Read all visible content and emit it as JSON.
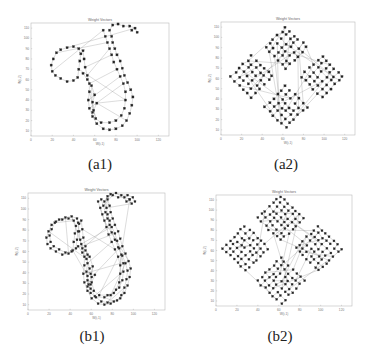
{
  "figure": {
    "captions": [
      "(a1)",
      "(a2)",
      "(b1)",
      "(b2)"
    ]
  },
  "chart_data": [
    {
      "id": "a1",
      "type": "scatter",
      "title": "Weight Vectors",
      "xlabel": "W(i,1)",
      "ylabel": "W(i,2)",
      "xlim": [
        0,
        130
      ],
      "ylim": [
        5,
        115
      ],
      "xticks": [
        0,
        20,
        40,
        60,
        80,
        100,
        120
      ],
      "yticks": [
        10,
        20,
        30,
        40,
        50,
        60,
        70,
        80,
        90,
        100,
        110
      ],
      "shape": "two-lobed curve (small circle upper-left, large loop right), single chain of nodes",
      "nodes": [
        [
          20,
          68
        ],
        [
          19,
          74
        ],
        [
          21,
          80
        ],
        [
          24,
          86
        ],
        [
          28,
          89
        ],
        [
          34,
          91
        ],
        [
          40,
          92
        ],
        [
          45,
          90
        ],
        [
          47,
          85
        ],
        [
          46,
          78
        ],
        [
          45,
          70
        ],
        [
          44,
          62
        ],
        [
          40,
          59
        ],
        [
          34,
          58
        ],
        [
          28,
          61
        ],
        [
          23,
          64
        ],
        [
          49,
          88
        ],
        [
          50,
          80
        ],
        [
          51,
          72
        ],
        [
          53,
          64
        ],
        [
          55,
          56
        ],
        [
          55,
          48
        ],
        [
          54,
          40
        ],
        [
          55,
          32
        ],
        [
          58,
          24
        ],
        [
          62,
          17
        ],
        [
          68,
          12
        ],
        [
          74,
          11
        ],
        [
          80,
          12
        ],
        [
          86,
          15
        ],
        [
          90,
          20
        ],
        [
          93,
          27
        ],
        [
          95,
          35
        ],
        [
          96,
          43
        ],
        [
          94,
          50
        ],
        [
          91,
          57
        ],
        [
          88,
          64
        ],
        [
          86,
          71
        ],
        [
          84,
          78
        ],
        [
          81,
          84
        ],
        [
          79,
          90
        ],
        [
          77,
          96
        ],
        [
          76,
          102
        ],
        [
          74,
          108
        ],
        [
          77,
          113
        ],
        [
          82,
          114
        ],
        [
          87,
          112
        ],
        [
          93,
          112
        ],
        [
          98,
          110
        ],
        [
          100,
          106
        ],
        [
          68,
          108
        ],
        [
          70,
          102
        ],
        [
          72,
          96
        ],
        [
          74,
          90
        ],
        [
          76,
          84
        ],
        [
          78,
          77
        ],
        [
          81,
          70
        ],
        [
          84,
          63
        ],
        [
          87,
          56
        ],
        [
          89,
          48
        ],
        [
          89,
          40
        ],
        [
          88,
          32
        ],
        [
          85,
          25
        ],
        [
          80,
          20
        ],
        [
          74,
          18
        ],
        [
          66,
          18
        ],
        [
          61,
          22
        ],
        [
          59,
          30
        ],
        [
          58,
          38
        ],
        [
          60,
          45
        ],
        [
          57,
          54
        ],
        [
          53,
          60
        ],
        [
          49,
          66
        ],
        [
          62,
          37
        ],
        [
          58,
          28
        ],
        [
          95,
          108
        ]
      ],
      "extra_edges": [
        [
          0,
          50
        ],
        [
          10,
          60
        ],
        [
          18,
          54
        ],
        [
          20,
          56
        ],
        [
          22,
          57
        ],
        [
          23,
          58
        ],
        [
          19,
          53
        ],
        [
          21,
          66
        ],
        [
          24,
          70
        ],
        [
          73,
          30
        ],
        [
          73,
          60
        ],
        [
          5,
          48
        ],
        [
          3,
          52
        ]
      ]
    },
    {
      "id": "a2",
      "type": "scatter",
      "title": "Weight Vectors",
      "xlabel": "W(i,1)",
      "ylabel": "W(i,2)",
      "xlim": [
        0,
        130
      ],
      "ylim": [
        5,
        115
      ],
      "xticks": [
        0,
        20,
        40,
        60,
        80,
        100,
        120
      ],
      "yticks": [
        10,
        20,
        30,
        40,
        50,
        60,
        70,
        80,
        90,
        100,
        110
      ],
      "shape": "diamond composed of four square-grid clusters (top, left, right, bottom)",
      "clusters": [
        {
          "name": "top",
          "center": [
            63,
            90
          ],
          "half_span": 20
        },
        {
          "name": "left",
          "center": [
            30,
            62
          ],
          "half_span": 20
        },
        {
          "name": "right",
          "center": [
            98,
            62
          ],
          "half_span": 20
        },
        {
          "name": "bottom",
          "center": [
            63,
            32
          ],
          "half_span": 20
        }
      ],
      "grid_per_cluster": 6
    },
    {
      "id": "b1",
      "type": "scatter",
      "title": "Weight Vectors",
      "xlabel": "W(i,1)",
      "ylabel": "W(i,2)",
      "xlim": [
        0,
        130
      ],
      "ylim": [
        5,
        115
      ],
      "xticks": [
        0,
        20,
        40,
        60,
        80,
        100,
        120
      ],
      "yticks": [
        10,
        20,
        30,
        40,
        50,
        60,
        70,
        80,
        90,
        100,
        110
      ],
      "shape": "two-lobed curve (same as a1) with double-row boundary nodes and dense interior edges",
      "offset_rows": 2
    },
    {
      "id": "b2",
      "type": "scatter",
      "title": "Weight Vectors",
      "xlabel": "W(i,1)",
      "ylabel": "W(i,2)",
      "xlim": [
        0,
        130
      ],
      "ylim": [
        5,
        115
      ],
      "xticks": [
        0,
        20,
        40,
        60,
        80,
        100,
        120
      ],
      "yticks": [
        10,
        20,
        30,
        40,
        50,
        60,
        70,
        80,
        90,
        100,
        110
      ],
      "shape": "diamond of four denser grid clusters with many connecting edges",
      "clusters": [
        {
          "name": "top",
          "center": [
            62,
            92
          ],
          "half_span": 22
        },
        {
          "name": "left",
          "center": [
            28,
            62
          ],
          "half_span": 22
        },
        {
          "name": "right",
          "center": [
            98,
            62
          ],
          "half_span": 22
        },
        {
          "name": "bottom",
          "center": [
            62,
            30
          ],
          "half_span": 22
        }
      ],
      "grid_per_cluster": 7
    }
  ]
}
